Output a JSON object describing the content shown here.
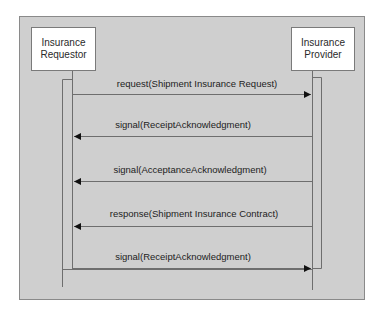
{
  "diagram": {
    "type": "sequence",
    "colors": {
      "frame_bg": "#cfcfcf",
      "frame_border": "#8a8a8a",
      "actor_bg": "#ffffff",
      "line": "#6e6e6e",
      "arrowhead": "#111111",
      "text": "#222222"
    },
    "actors": [
      {
        "id": "requestor",
        "line1": "Insurance",
        "line2": "Requestor"
      },
      {
        "id": "provider",
        "line1": "Insurance",
        "line2": "Provider"
      }
    ],
    "messages": [
      {
        "label": "request(Shipment Insurance Request)",
        "from": "requestor",
        "to": "provider"
      },
      {
        "label": "signal(ReceiptAcknowledgment)",
        "from": "provider",
        "to": "requestor"
      },
      {
        "label": "signal(AcceptanceAcknowledgment)",
        "from": "provider",
        "to": "requestor"
      },
      {
        "label": "response(Shipment Insurance Contract)",
        "from": "provider",
        "to": "requestor"
      },
      {
        "label": "signal(ReceiptAcknowledgment)",
        "from": "requestor",
        "to": "provider"
      }
    ]
  }
}
